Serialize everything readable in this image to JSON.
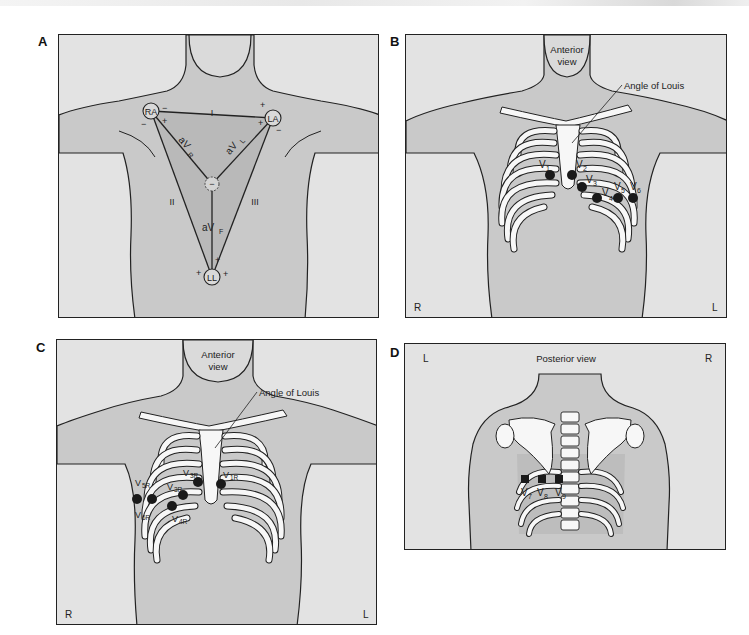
{
  "colors": {
    "panel_background": "#e3e3e3",
    "body_fill": "#c9c9c9",
    "shaded_fill": "#b9b9b9",
    "bone_fill": "#f7f7f7",
    "electrode_fill": "#1a1a1a",
    "outline": "#222222"
  },
  "panels": {
    "a": {
      "letter": "A",
      "electrodes": {
        "ra": "RA",
        "la": "LA",
        "ll": "LL",
        "center": "−"
      },
      "leads": {
        "i": "I",
        "ii": "II",
        "iii": "III",
        "avr": "aV",
        "avr_sub": "R",
        "avl": "aV",
        "avl_sub": "L",
        "avf": "aV",
        "avf_sub": "F"
      },
      "polarity": {
        "plus": "+",
        "minus": "−"
      }
    },
    "b": {
      "letter": "B",
      "view_label_line1": "Anterior",
      "view_label_line2": "view",
      "landmark_label": "Angle of Louis",
      "corner_left": "R",
      "corner_right": "L",
      "electrodes": [
        {
          "name": "V",
          "sub": "1"
        },
        {
          "name": "V",
          "sub": "2"
        },
        {
          "name": "V",
          "sub": "3"
        },
        {
          "name": "V",
          "sub": "4"
        },
        {
          "name": "V",
          "sub": "5"
        },
        {
          "name": "V",
          "sub": "6"
        }
      ]
    },
    "c": {
      "letter": "C",
      "view_label_line1": "Anterior",
      "view_label_line2": "view",
      "landmark_label": "Angle of Louis",
      "corner_left": "R",
      "corner_right": "L",
      "electrodes": [
        {
          "name": "V",
          "sub": "1R"
        },
        {
          "name": "V",
          "sub": "3R"
        },
        {
          "name": "V",
          "sub": "3R"
        },
        {
          "name": "V",
          "sub": "4R"
        },
        {
          "name": "V",
          "sub": "5R"
        },
        {
          "name": "V",
          "sub": "6R"
        }
      ]
    },
    "d": {
      "letter": "D",
      "view_label": "Posterior view",
      "corner_left": "L",
      "corner_right": "R",
      "electrodes": [
        {
          "name": "V",
          "sub": "7"
        },
        {
          "name": "V",
          "sub": "8"
        },
        {
          "name": "V",
          "sub": "9"
        }
      ]
    }
  }
}
